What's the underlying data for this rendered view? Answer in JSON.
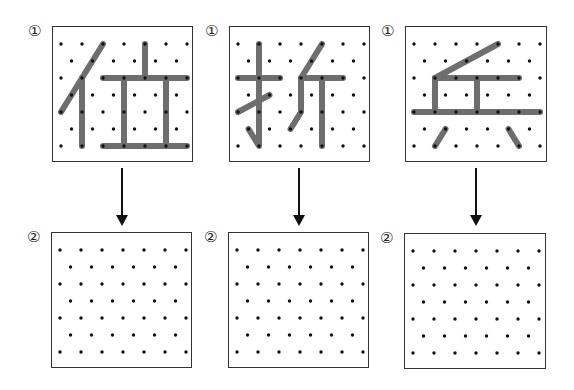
{
  "colors": {
    "stroke": "#6e6e6e",
    "dot": "#111111",
    "border": "#333333",
    "arrow": "#111111"
  },
  "grid": {
    "rows": 7,
    "even_row_cols": 7,
    "odd_row_cols": 6,
    "col_spacing": 21,
    "row_spacing": 17
  },
  "columns": [
    {
      "character": "位",
      "top": {
        "label": "①",
        "x": 52,
        "y": 26,
        "w": 141,
        "h": 136,
        "strokes": [
          [
            [
              2,
              0
            ],
            [
              0,
              4
            ]
          ],
          [
            [
              1,
              2
            ],
            [
              1,
              6
            ]
          ],
          [
            [
              4,
              0
            ],
            [
              4,
              2
            ]
          ],
          [
            [
              2,
              2
            ],
            [
              6,
              2
            ]
          ],
          [
            [
              3,
              2
            ],
            [
              3,
              6
            ]
          ],
          [
            [
              5,
              2
            ],
            [
              5,
              6
            ]
          ],
          [
            [
              2,
              6
            ],
            [
              6,
              6
            ]
          ]
        ]
      },
      "arrow": {
        "x": 122,
        "y1": 168,
        "y2": 226
      },
      "bottom": {
        "label": "②",
        "x": 51,
        "y": 232,
        "w": 141,
        "h": 136,
        "strokes": []
      }
    },
    {
      "character": "折",
      "top": {
        "label": "①",
        "x": 229,
        "y": 26,
        "w": 141,
        "h": 136,
        "strokes": [
          [
            [
              0,
              2
            ],
            [
              2,
              2
            ]
          ],
          [
            [
              1,
              0
            ],
            [
              1,
              6
            ],
            [
              0.5,
              5
            ]
          ],
          [
            [
              0,
              4
            ],
            [
              1.5,
              3
            ]
          ],
          [
            [
              4,
              0
            ],
            [
              3,
              2
            ],
            [
              3,
              4
            ],
            [
              2.5,
              5
            ]
          ],
          [
            [
              3,
              2
            ],
            [
              5,
              2
            ]
          ],
          [
            [
              4,
              2
            ],
            [
              4,
              6
            ]
          ]
        ]
      },
      "arrow": {
        "x": 299,
        "y1": 168,
        "y2": 226
      },
      "bottom": {
        "label": "②",
        "x": 228,
        "y": 232,
        "w": 141,
        "h": 136,
        "strokes": []
      }
    },
    {
      "character": "乒",
      "top": {
        "label": "①",
        "x": 405,
        "y": 26,
        "w": 142,
        "h": 136,
        "strokes": [
          [
            [
              1,
              2
            ],
            [
              4,
              0
            ]
          ],
          [
            [
              1,
              2
            ],
            [
              5,
              2
            ]
          ],
          [
            [
              1,
              2
            ],
            [
              1,
              4
            ]
          ],
          [
            [
              3,
              2
            ],
            [
              3,
              4
            ]
          ],
          [
            [
              0,
              4
            ],
            [
              6,
              4
            ]
          ],
          [
            [
              1,
              6
            ],
            [
              1.5,
              5
            ]
          ],
          [
            [
              4.5,
              5
            ],
            [
              5,
              6
            ]
          ]
        ]
      },
      "arrow": {
        "x": 476,
        "y1": 168,
        "y2": 226
      },
      "bottom": {
        "label": "②",
        "x": 404,
        "y": 233,
        "w": 142,
        "h": 136,
        "strokes": []
      }
    }
  ]
}
